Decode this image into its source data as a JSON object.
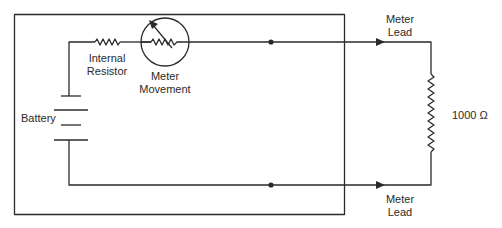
{
  "diagram": {
    "type": "circuit-schematic",
    "title": "",
    "stroke_color": "#2a2a2a",
    "background": "#ffffff",
    "components": {
      "battery": {
        "label": "Battery"
      },
      "internal_resistor": {
        "label_line1": "Internal",
        "label_line2": "Resistor"
      },
      "meter_movement": {
        "label_line1": "Meter",
        "label_line2": "Movement"
      },
      "top_meter_lead": {
        "label_line1": "Meter",
        "label_line2": "Lead"
      },
      "bottom_meter_lead": {
        "label_line1": "Meter",
        "label_line2": "Lead"
      },
      "load_resistor": {
        "label": "1000 Ω",
        "value_ohms": 1000
      }
    },
    "enclosure": "ohmmeter-housing"
  }
}
